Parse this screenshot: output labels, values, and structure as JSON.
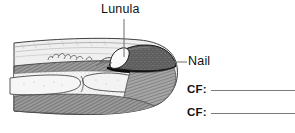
{
  "figure": {
    "labels": [
      {
        "id": "lunula",
        "text": "Lunula"
      },
      {
        "id": "nail",
        "text": "Nail"
      }
    ],
    "blanks": [
      {
        "id": "cf-1",
        "label": "CF:",
        "value": ""
      },
      {
        "id": "cf-2",
        "label": "CF:",
        "value": ""
      }
    ],
    "colors": {
      "background": "#ffffff",
      "ink": "#111111",
      "leader_line": "#6f6f6f",
      "blank_rule": "#7a7a7a",
      "nail_plate": "#5d5d5d",
      "nail_edge": "#111111",
      "lunula_fill": "#f2f2f2",
      "skin_light": "#ececec",
      "dermis_hatch": "#8a8a8a",
      "bone_fill": "#f4f4f4",
      "outline": "#3a3a3a"
    }
  }
}
